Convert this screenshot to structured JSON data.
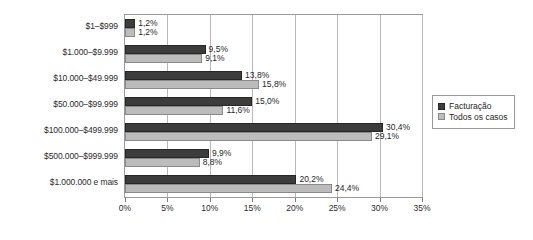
{
  "chart_data": {
    "type": "bar",
    "orientation": "horizontal",
    "title": "",
    "xlabel": "",
    "ylabel": "",
    "xlim": [
      0,
      35
    ],
    "xticks": [
      "0%",
      "5%",
      "10%",
      "15%",
      "20%",
      "25%",
      "30%",
      "35%"
    ],
    "xtick_values": [
      0,
      5,
      10,
      15,
      20,
      25,
      30,
      35
    ],
    "grid": true,
    "legend_position": "right",
    "categories": [
      "$1–$999",
      "$1.000–$9.999",
      "$10.000–$49.999",
      "$50.000–$99.999",
      "$100.000–$499.999",
      "$500.000–$999.999",
      "$1.000.000 e mais"
    ],
    "series": [
      {
        "name": "Facturação",
        "color": "#3c3c3c",
        "values": [
          1.2,
          9.5,
          13.8,
          15.0,
          30.4,
          9.9,
          20.2
        ],
        "labels": [
          "1,2%",
          "9,5%",
          "13,8%",
          "15,0%",
          "30,4%",
          "9,9%",
          "20,2%"
        ]
      },
      {
        "name": "Todos os casos",
        "color": "#bcbcbc",
        "values": [
          1.2,
          9.1,
          15.8,
          11.6,
          29.1,
          8.8,
          24.4
        ],
        "labels": [
          "1,2%",
          "9,1%",
          "15,8%",
          "11,6%",
          "29,1%",
          "8,8%",
          "24,4%"
        ]
      }
    ]
  }
}
